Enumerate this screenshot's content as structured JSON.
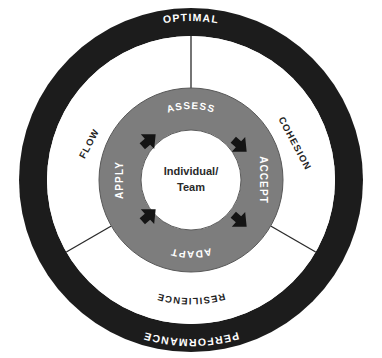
{
  "diagram": {
    "colors": {
      "outer_ring": "#1c1c1c",
      "middle_ring": "#ffffff",
      "inner_ring": "#7d7d7d",
      "center": "#ffffff",
      "arrow": "#141414",
      "divider": "#2a2a2a",
      "outer_text": "#ffffff",
      "middle_text": "#1f1f1f",
      "inner_text": "#ffffff",
      "center_text": "#2a2a2a"
    },
    "outer_ring": {
      "name": "outer-ring",
      "labels": [
        {
          "id": "optimal",
          "text": "OPTIMAL",
          "position": "top"
        },
        {
          "id": "performance",
          "text": "PERFORMANCE",
          "position": "bottom"
        }
      ]
    },
    "middle_ring": {
      "name": "middle-ring",
      "labels": [
        {
          "id": "flow",
          "text": "FLOW",
          "position": "left",
          "rotation": -62
        },
        {
          "id": "cohesion",
          "text": "COHESION",
          "position": "right",
          "rotation": 62
        },
        {
          "id": "resilience",
          "text": "RESILIENCE",
          "position": "bottom",
          "rotation": 0
        }
      ],
      "divider_angles_deg": [
        90,
        210,
        330
      ]
    },
    "inner_ring": {
      "name": "inner-ring",
      "labels": [
        {
          "id": "assess",
          "text": "ASSESS",
          "position": "top",
          "rotation": 0
        },
        {
          "id": "accept",
          "text": "ACCEPT",
          "position": "right",
          "rotation": 90
        },
        {
          "id": "adapt",
          "text": "ADAPT",
          "position": "bottom",
          "rotation": 0
        },
        {
          "id": "apply",
          "text": "APPLY",
          "position": "left",
          "rotation": -90
        }
      ],
      "arrows": [
        {
          "id": "arrow-nw",
          "position": "north-west",
          "direction": "clockwise"
        },
        {
          "id": "arrow-ne",
          "position": "north-east",
          "direction": "clockwise"
        },
        {
          "id": "arrow-se",
          "position": "south-east",
          "direction": "clockwise"
        },
        {
          "id": "arrow-sw",
          "position": "south-west",
          "direction": "clockwise"
        }
      ]
    },
    "center": {
      "name": "center-hub",
      "line1": "Individual/",
      "line2": "Team"
    }
  }
}
